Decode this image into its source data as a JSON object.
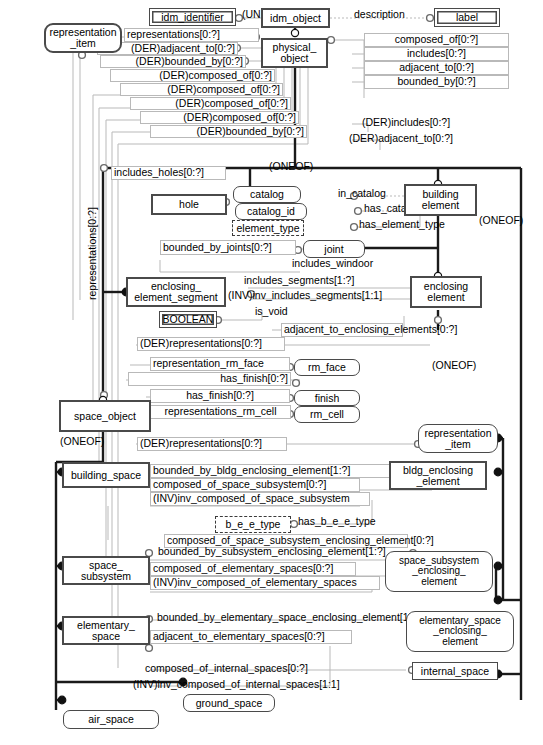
{
  "diagram": {
    "notation": "EXPRESS-G",
    "colors": {
      "entity_border": "#4a4a4a",
      "relation_line": "#b9b9b9",
      "supertype_line": "#1a1a1a",
      "background": "#ffffff"
    }
  },
  "entities": [
    {
      "id": "representation_item_top",
      "label": "representation\n_item",
      "kind": "select-type"
    },
    {
      "id": "idm_identifier",
      "label": "idm_identifier",
      "kind": "defined-type"
    },
    {
      "id": "idm_object",
      "label": "idm_object",
      "kind": "entity"
    },
    {
      "id": "label",
      "label": "label",
      "kind": "defined-type"
    },
    {
      "id": "physical_object",
      "label": "physical_\nobject",
      "kind": "entity"
    },
    {
      "id": "catalog",
      "label": "catalog",
      "kind": "select-type"
    },
    {
      "id": "catalog_id",
      "label": "catalog_id",
      "kind": "select-type"
    },
    {
      "id": "element_type",
      "label": "element_type",
      "kind": "enumeration"
    },
    {
      "id": "hole",
      "label": "hole",
      "kind": "entity"
    },
    {
      "id": "building_element",
      "label": "building\nelement",
      "kind": "entity"
    },
    {
      "id": "joint",
      "label": "joint",
      "kind": "select-type"
    },
    {
      "id": "enclosing_element_segment",
      "label": "enclosing_\nelement_segment",
      "kind": "entity"
    },
    {
      "id": "enclosing_element",
      "label": "enclosing\nelement",
      "kind": "entity"
    },
    {
      "id": "boolean",
      "label": "BOOLEAN",
      "kind": "defined-type"
    },
    {
      "id": "rm_face",
      "label": "rm_face",
      "kind": "select-type"
    },
    {
      "id": "finish",
      "label": "finish",
      "kind": "select-type"
    },
    {
      "id": "rm_cell",
      "label": "rm_cell",
      "kind": "select-type"
    },
    {
      "id": "space_object",
      "label": "space_object",
      "kind": "entity"
    },
    {
      "id": "representation_item_mid",
      "label": "representation\n_item",
      "kind": "select-type"
    },
    {
      "id": "building_space",
      "label": "building_space",
      "kind": "entity"
    },
    {
      "id": "bldg_enclosing_element",
      "label": "bldg_enclosing\n_element",
      "kind": "entity"
    },
    {
      "id": "b_e_e_type",
      "label": "b_e_e_type",
      "kind": "enumeration"
    },
    {
      "id": "space_subsystem",
      "label": "space_\nsubsystem",
      "kind": "entity"
    },
    {
      "id": "space_subsystem_enclosing_element",
      "label": "space_subsystem\n_enclosing_\nelement",
      "kind": "select-type"
    },
    {
      "id": "elementary_space",
      "label": "elementary_\nspace",
      "kind": "entity"
    },
    {
      "id": "elementary_space_enclosing_element",
      "label": "elementary_space\n_enclosing_\nelement",
      "kind": "select-type"
    },
    {
      "id": "internal_space",
      "label": "internal_space",
      "kind": "entity"
    },
    {
      "id": "ground_space",
      "label": "ground_space",
      "kind": "select-type"
    },
    {
      "id": "air_space",
      "label": "air_space",
      "kind": "select-type"
    }
  ],
  "attributes": [
    {
      "id": "a_unique_id",
      "text": "(UNIQUE)id"
    },
    {
      "id": "a_description",
      "text": "description"
    },
    {
      "id": "a_representations",
      "text": "representations[0:?]"
    },
    {
      "id": "a_der_adjacent_to",
      "text": "(DER)adjacent_to[0:?]"
    },
    {
      "id": "a_der_bounded_by",
      "text": "(DER)bounded_by[0:?]"
    },
    {
      "id": "a_der_composed_of_1",
      "text": "(DER)composed_of[0:?]"
    },
    {
      "id": "a_der_composed_of_2",
      "text": "(DER)composed_of[0:?]"
    },
    {
      "id": "a_der_composed_of_3",
      "text": "(DER)composed_of[0:?]"
    },
    {
      "id": "a_der_composed_of_4",
      "text": "(DER)composed_of[0:?]"
    },
    {
      "id": "a_der_bounded_by_2",
      "text": "(DER)bounded_by[0:?]"
    },
    {
      "id": "a_composed_of",
      "text": "composed_of[0:?]"
    },
    {
      "id": "a_includes",
      "text": "includes[0:?]"
    },
    {
      "id": "a_adjacent_to",
      "text": "adjacent_to[0:?]"
    },
    {
      "id": "a_bounded_by",
      "text": "bounded_by[0:?]"
    },
    {
      "id": "a_der_includes",
      "text": "(DER)includes[0:?]"
    },
    {
      "id": "a_der_adjacent_to_2",
      "text": "(DER)adjacent_to[0:?]"
    },
    {
      "id": "a_includes_holes",
      "text": "includes_holes[0:?]"
    },
    {
      "id": "a_in_catalog",
      "text": "in_catalog"
    },
    {
      "id": "a_has_catalog_id",
      "text": "has_catalog_id"
    },
    {
      "id": "a_has_element_type",
      "text": "has_element_type"
    },
    {
      "id": "a_bounded_by_joints",
      "text": "bounded_by_joints[0:?]"
    },
    {
      "id": "a_includes_windoor",
      "text": "includes_windoor"
    },
    {
      "id": "a_includes_segments",
      "text": "includes_segments[1:?]"
    },
    {
      "id": "a_inv_includes_segments",
      "text": "(INV)inv_includes_segments[1:1]"
    },
    {
      "id": "a_is_void",
      "text": "is_void"
    },
    {
      "id": "a_adjacent_to_enclosing_elements",
      "text": "adjacent_to_enclosing_elements[0:?]"
    },
    {
      "id": "a_der_representations_1",
      "text": "(DER)representations[0:?]"
    },
    {
      "id": "a_representation_rm_face",
      "text": "representation_rm_face"
    },
    {
      "id": "a_has_finish_1",
      "text": "has_finish[0:?]"
    },
    {
      "id": "a_has_finish_2",
      "text": "has_finish[0:?]"
    },
    {
      "id": "a_representations_rm_cell",
      "text": "representations_rm_cell"
    },
    {
      "id": "a_der_representations_2",
      "text": "(DER)representations[0:?]"
    },
    {
      "id": "a_representations_vertical",
      "text": "representations[0:?]"
    },
    {
      "id": "a_bounded_by_bldg",
      "text": "bounded_by_bldg_enclosing_element[1:?]"
    },
    {
      "id": "a_composed_of_space_subsystem",
      "text": "composed_of_space_subsystem[0:?]"
    },
    {
      "id": "a_inv_composed_of_space_subsystem",
      "text": "(INV)inv_composed_of_space_subsystem"
    },
    {
      "id": "a_has_b_e_e_type",
      "text": "has_b_e_e_type"
    },
    {
      "id": "a_composed_of_sses",
      "text": "composed_of_space_subsystem_enclosing_element[0:?]"
    },
    {
      "id": "a_bounded_by_subsystem",
      "text": "bounded_by_subsystem_enclosing_element[1:?]"
    },
    {
      "id": "a_composed_of_elementary_spaces",
      "text": "composed_of_elementary_spaces[0:?]"
    },
    {
      "id": "a_inv_composed_of_elementary_spaces",
      "text": "(INV)inv_composed_of_elementary_spaces"
    },
    {
      "id": "a_bounded_by_elementary",
      "text": "bounded_by_elementary_space_enclosing_element[1:?]"
    },
    {
      "id": "a_adjacent_to_elementary_spaces",
      "text": "adjacent_to_elementary_spaces[0:?]"
    },
    {
      "id": "a_composed_of_internal_spaces",
      "text": "composed_of_internal_spaces[0:?]"
    },
    {
      "id": "a_inv_composed_of_internal_spaces",
      "text": "(INV)inv_composed_of_internal_spaces[1:1]"
    }
  ],
  "constraints": [
    {
      "id": "oneof_1",
      "text": "(ONEOF)"
    },
    {
      "id": "oneof_2",
      "text": "(ONEOF)"
    },
    {
      "id": "oneof_3",
      "text": "(ONEOF)"
    },
    {
      "id": "oneof_4",
      "text": "(ONEOF)"
    }
  ]
}
